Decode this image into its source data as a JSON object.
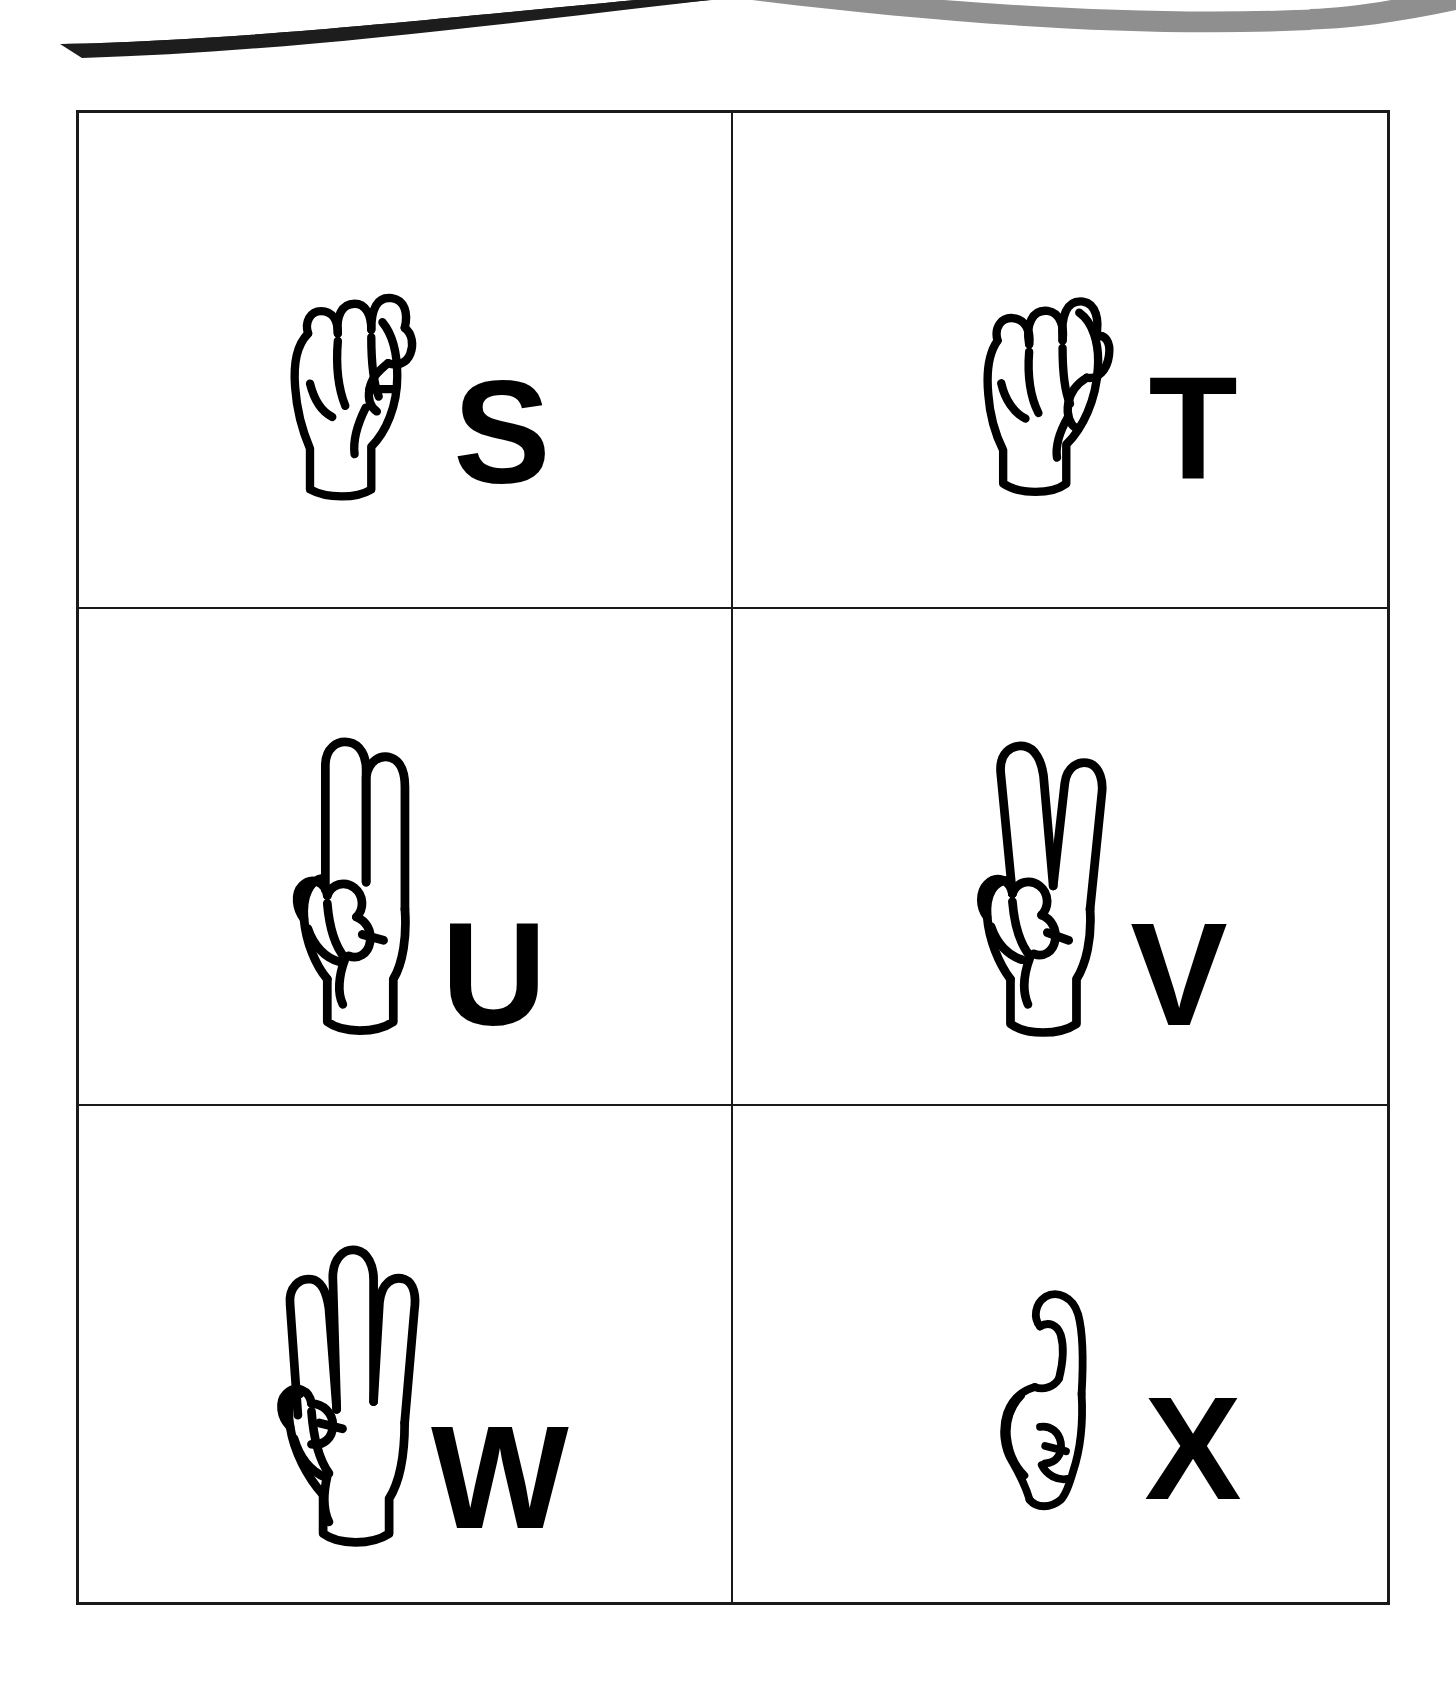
{
  "page": {
    "background_color": "#ffffff",
    "line_color": "#1a1a1a",
    "letter_color": "#000000"
  },
  "header_decoration": {
    "name": "wave-banner",
    "left_swoosh_color": "#1d1d1d",
    "right_swoosh_color": "#8f8f8f"
  },
  "grid": {
    "columns": 2,
    "rows": 3,
    "border_color": "#1a1a1a",
    "cells": [
      {
        "letter": "S",
        "icon": "asl-hand-s-icon",
        "description": "closed fist with thumb crossing over folded fingers",
        "hand_variant": "fist"
      },
      {
        "letter": "T",
        "icon": "asl-hand-t-icon",
        "description": "fist with thumb tucked between index and middle finger",
        "hand_variant": "fist-thumb-tuck"
      },
      {
        "letter": "U",
        "icon": "asl-hand-u-icon",
        "description": "index and middle finger extended together upward",
        "hand_variant": "two-fingers-together"
      },
      {
        "letter": "V",
        "icon": "asl-hand-v-icon",
        "description": "index and middle finger extended apart in a V",
        "hand_variant": "two-fingers-apart"
      },
      {
        "letter": "W",
        "icon": "asl-hand-w-icon",
        "description": "index, middle and ring finger extended upward",
        "hand_variant": "three-fingers"
      },
      {
        "letter": "X",
        "icon": "asl-hand-x-icon",
        "description": "fist with index finger bent into a hook",
        "hand_variant": "hooked-index"
      }
    ]
  }
}
